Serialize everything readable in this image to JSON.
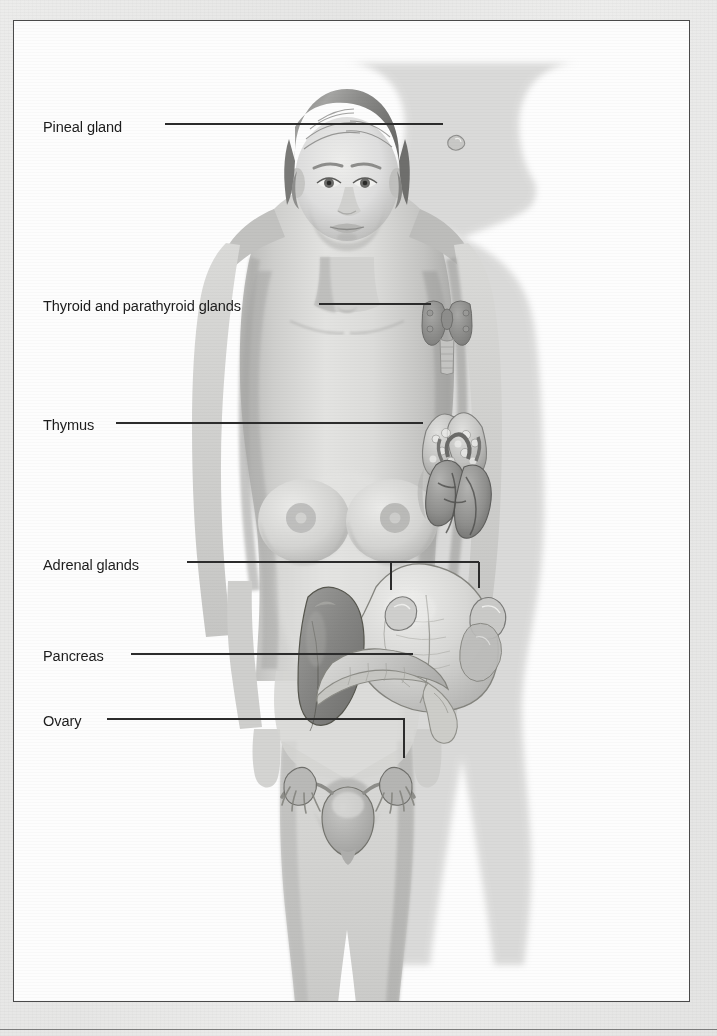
{
  "figure": {
    "border_color": "#4a4a4a",
    "background_color": "#fdfdfd",
    "page_background_color": "#e9e9e9",
    "label_text_color": "#1d1d1d",
    "leader_line_color": "#2c2c2c"
  },
  "labels": [
    {
      "id": "pineal",
      "text": "Pineal gland",
      "x": 42,
      "y": 117,
      "leader_start_x": 164,
      "leader_y": 123,
      "leader_end_x": 442,
      "drop_x": null,
      "drop_end_y": null,
      "endpoint": "dot"
    },
    {
      "id": "thyroid",
      "text": "Thyroid and parathyroid glands",
      "x": 42,
      "y": 296,
      "leader_start_x": 318,
      "leader_y": 303,
      "leader_end_x": 430,
      "drop_x": null,
      "drop_end_y": null,
      "endpoint": "flat"
    },
    {
      "id": "thymus",
      "text": "Thymus",
      "x": 42,
      "y": 415,
      "leader_start_x": 115,
      "leader_y": 422,
      "leader_end_x": 422,
      "drop_x": null,
      "drop_end_y": null,
      "endpoint": "flat"
    },
    {
      "id": "adrenal",
      "text": "Adrenal glands",
      "x": 42,
      "y": 555,
      "leader_start_x": 186,
      "leader_y": 561,
      "leader_end_x": 478,
      "drop_x": 390,
      "drop_end_y": 589,
      "endpoint": "bracket"
    },
    {
      "id": "pancreas",
      "text": "Pancreas",
      "x": 42,
      "y": 646,
      "leader_start_x": 130,
      "leader_y": 653,
      "leader_end_x": 412,
      "drop_x": null,
      "drop_end_y": null,
      "endpoint": "flat"
    },
    {
      "id": "ovary",
      "text": "Ovary",
      "x": 42,
      "y": 711,
      "leader_start_x": 106,
      "leader_y": 718,
      "leader_end_x": 403,
      "drop_x": 403,
      "drop_end_y": 757,
      "endpoint": "elbow"
    }
  ],
  "organs": [
    {
      "name": "pineal-gland",
      "label_ref": "pineal"
    },
    {
      "name": "thyroid-gland",
      "label_ref": "thyroid"
    },
    {
      "name": "parathyroid-glands",
      "label_ref": "thyroid"
    },
    {
      "name": "thymus",
      "label_ref": "thymus"
    },
    {
      "name": "adrenal-gland-left",
      "label_ref": "adrenal"
    },
    {
      "name": "adrenal-gland-right",
      "label_ref": "adrenal"
    },
    {
      "name": "pancreas",
      "label_ref": "pancreas"
    },
    {
      "name": "ovary-left",
      "label_ref": "ovary"
    },
    {
      "name": "ovary-right",
      "label_ref": "ovary"
    },
    {
      "name": "heart",
      "label_ref": null
    },
    {
      "name": "stomach",
      "label_ref": null
    },
    {
      "name": "liver",
      "label_ref": null
    },
    {
      "name": "uterus",
      "label_ref": null
    },
    {
      "name": "fallopian-tubes",
      "label_ref": null
    }
  ],
  "ghost_text": [
    {
      "text": "the organs   of",
      "x": 62,
      "y": 58,
      "size": 15,
      "bold": false
    },
    {
      "text": "the body",
      "x": 386,
      "y": 54,
      "size": 15,
      "bold": false
    },
    {
      "text": "duce hormones   tha",
      "x": 198,
      "y": 96,
      "size": 14,
      "bold": false
    },
    {
      "text": "the bloodstream",
      "x": 410,
      "y": 140,
      "size": 14,
      "bold": false
    },
    {
      "text": "le to   regulate many processes",
      "x": 150,
      "y": 196,
      "size": 14,
      "bold": false
    },
    {
      "text": "The endocrine system",
      "x": 196,
      "y": 366,
      "size": 21,
      "bold": true
    },
    {
      "text": "od glucose levels",
      "x": 176,
      "y": 448,
      "size": 14,
      "bold": false
    },
    {
      "text": "nes that act on cells",
      "x": 258,
      "y": 478,
      "size": 14,
      "bold": false
    },
    {
      "text": "ry gland",
      "x": 166,
      "y": 582,
      "size": 14,
      "bold": false
    },
    {
      "text": "of the hypo",
      "x": 322,
      "y": 612,
      "size": 14,
      "bold": false
    },
    {
      "text": "that travel",
      "x": 96,
      "y": 648,
      "size": 14,
      "bold": false
    },
    {
      "text": "in the blood",
      "x": 488,
      "y": 686,
      "size": 14,
      "bold": false
    },
    {
      "text": "organ",
      "x": 560,
      "y": 246,
      "size": 14,
      "bold": false
    },
    {
      "text": "ells",
      "x": 624,
      "y": 318,
      "size": 14,
      "bold": false
    },
    {
      "text": "rget",
      "x": 630,
      "y": 506,
      "size": 14,
      "bold": false
    },
    {
      "text": "gland",
      "x": 616,
      "y": 824,
      "size": 14,
      "bold": false
    },
    {
      "text": "secrete",
      "x": 604,
      "y": 902,
      "size": 14,
      "bold": false
    }
  ]
}
